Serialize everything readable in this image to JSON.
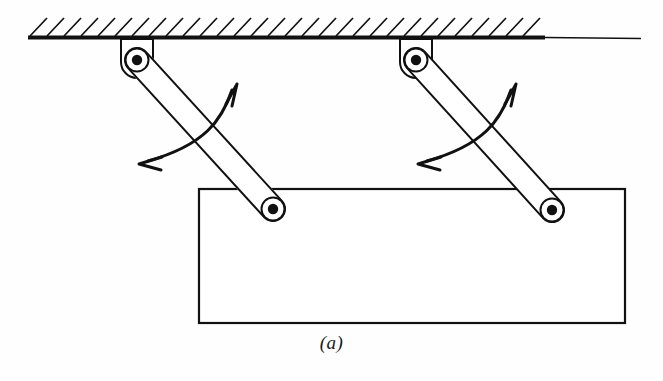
{
  "figure": {
    "caption": "(a)",
    "background_color": "#fefefe",
    "ink_color": "#111111",
    "elements": {
      "ground": {
        "name": "hatched ceiling",
        "line_x_start": 28,
        "line_x_end": 545,
        "line_y": 37,
        "line_thickness": 4,
        "hatch_count": 30,
        "hatch_angle_deg": 45
      },
      "links": [
        {
          "name": "left swinging link",
          "top_pivot_x": 137,
          "top_pivot_y": 60,
          "bottom_pivot_x": 273,
          "bottom_pivot_y": 209,
          "bar_width": 13
        },
        {
          "name": "right swinging link",
          "top_pivot_x": 416,
          "top_pivot_y": 60,
          "bottom_pivot_x": 552,
          "bottom_pivot_y": 210,
          "bar_width": 13
        }
      ],
      "block": {
        "name": "suspended rectangular body",
        "x": 199,
        "y": 189,
        "width": 426,
        "height": 134,
        "stroke_width": 2.2
      },
      "arrows": [
        {
          "name": "left oscillation arrow",
          "type": "double-headed curved arrow",
          "tip_upper_x": 237,
          "tip_upper_y": 85,
          "tip_lower_x": 140,
          "tip_lower_y": 163
        },
        {
          "name": "right oscillation arrow",
          "type": "double-headed curved arrow",
          "tip_upper_x": 516,
          "tip_upper_y": 85,
          "tip_lower_x": 419,
          "tip_lower_y": 163
        }
      ]
    }
  }
}
